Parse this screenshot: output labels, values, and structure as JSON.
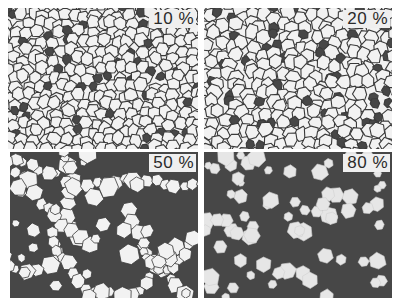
{
  "figure": {
    "colors": {
      "background": "#ffffff",
      "grain": "#f2f2f2",
      "boundary": "#3a3a3a",
      "second_phase": "#474747"
    },
    "panels": [
      {
        "id": "p10",
        "label": "10 %",
        "fraction": 0.1,
        "x": 8,
        "y": 8,
        "w": 190,
        "h": 141,
        "seed": 11,
        "grain_size": 11,
        "mode": "network"
      },
      {
        "id": "p20",
        "label": "20 %",
        "fraction": 0.2,
        "x": 204,
        "y": 8,
        "w": 188,
        "h": 141,
        "seed": 23,
        "grain_size": 12,
        "mode": "network"
      },
      {
        "id": "p50",
        "label": "50 %",
        "fraction": 0.5,
        "x": 10,
        "y": 152,
        "w": 188,
        "h": 146,
        "seed": 37,
        "grain_size": 12,
        "mode": "clusters"
      },
      {
        "id": "p80",
        "label": "80 %",
        "fraction": 0.8,
        "x": 204,
        "y": 152,
        "w": 188,
        "h": 146,
        "seed": 51,
        "grain_size": 9,
        "mode": "isolated"
      }
    ]
  }
}
